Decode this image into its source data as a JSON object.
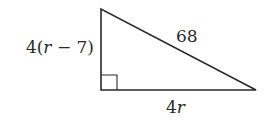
{
  "diagram": {
    "type": "right-triangle",
    "labels": {
      "vertical_leg": {
        "prefix": "4(",
        "var": "r",
        "suffix": " − 7)"
      },
      "hypotenuse": "68",
      "horizontal_leg": {
        "prefix": "4",
        "var": "r"
      }
    },
    "right_angle_marker": true,
    "colors": {
      "stroke": "#2a2a2a",
      "background": "#ffffff"
    }
  }
}
